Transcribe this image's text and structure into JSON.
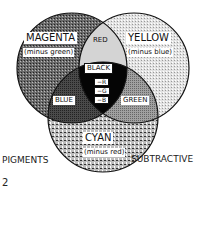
{
  "diagram": {
    "type": "venn-3-circle",
    "title_left": "PIGMENTS",
    "title_right": "SUBTRACTIVE",
    "figure_number": "2",
    "circles": [
      {
        "name": "MAGENTA",
        "subtitle": "(minus green)",
        "fill": "#4a4a4a"
      },
      {
        "name": "YELLOW",
        "subtitle": "(minus blue)",
        "fill": "#cfcfcf"
      },
      {
        "name": "CYAN",
        "subtitle": "(minus red)",
        "fill": "#8a8a8a"
      }
    ],
    "overlaps": {
      "magenta_yellow": "RED",
      "magenta_cyan": "BLUE",
      "yellow_cyan": "GREEN",
      "all_three": "BLACK"
    },
    "center_subtractions": [
      "−R",
      "−G",
      "−B"
    ],
    "colors": {
      "outline": "#111111",
      "black_center": "#050505",
      "red_region": "#bdbdbd",
      "blue_region": "#555555",
      "green_region": "#9a9a9a"
    }
  }
}
